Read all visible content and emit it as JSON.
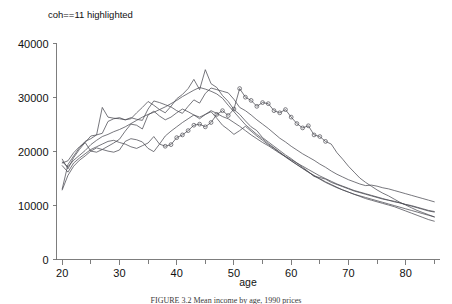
{
  "figure": {
    "caption": "FIGURE 3.2  Mean income by age, 1990 prices"
  },
  "chart_data": {
    "type": "line",
    "title": "coh==11 highlighted",
    "xlabel": "age",
    "ylabel": "",
    "xlim": [
      19,
      86
    ],
    "ylim": [
      0,
      42000
    ],
    "grid": false,
    "legend": "none",
    "xticks": [
      20,
      30,
      40,
      50,
      60,
      70,
      80
    ],
    "xminorticks": [
      25,
      35,
      45,
      55,
      65,
      75,
      85
    ],
    "yticks": [
      0,
      10000,
      20000,
      30000,
      40000
    ],
    "xticklabels": [
      "20",
      "30",
      "40",
      "50",
      "60",
      "70",
      "80"
    ],
    "yticklabels": [
      "0",
      "10000",
      "20000",
      "30000",
      "40000"
    ],
    "highlighted_series": "coh==11",
    "marker": "open-circle",
    "series": [
      {
        "name": "coh==7",
        "highlighted": false,
        "x": [
          20,
          21,
          22,
          23,
          24,
          25,
          26,
          27,
          28,
          29,
          30,
          31,
          32,
          33,
          34,
          35,
          36,
          37,
          38,
          39,
          40,
          41,
          42,
          43,
          44,
          45,
          46,
          47,
          48,
          49,
          50,
          51,
          52,
          53,
          54,
          55,
          56,
          57,
          58,
          59,
          60,
          61,
          62,
          63,
          64,
          65,
          66,
          67,
          68,
          69,
          70,
          71,
          72,
          73,
          74,
          75,
          76,
          77,
          78,
          79,
          80,
          81,
          82,
          83,
          84,
          85
        ],
        "y": [
          18600,
          16800,
          18900,
          20400,
          21700,
          22900,
          23100,
          23400,
          25600,
          26100,
          26300,
          25900,
          26100,
          27200,
          28200,
          29300,
          28600,
          27800,
          27200,
          28400,
          29800,
          30600,
          31700,
          33400,
          31500,
          35200,
          32600,
          31900,
          30400,
          29300,
          27800,
          26900,
          25700,
          24600,
          23900,
          22600,
          21800,
          21000,
          20200,
          19400,
          18700,
          17900,
          17100,
          16300,
          15400,
          15200,
          14900,
          14300,
          13900,
          13500,
          13100,
          12700,
          12400,
          12100,
          11800,
          11500,
          11200,
          11000,
          10700,
          10500,
          10200,
          9900,
          9600,
          9300,
          9000,
          8800
        ]
      },
      {
        "name": "coh==8",
        "highlighted": false,
        "x": [
          20,
          21,
          22,
          23,
          24,
          25,
          26,
          27,
          28,
          29,
          30,
          31,
          32,
          33,
          34,
          35,
          36,
          37,
          38,
          39,
          40,
          41,
          42,
          43,
          44,
          45,
          46,
          47,
          48,
          49,
          50,
          51,
          52,
          53,
          54,
          55,
          56,
          57,
          58,
          59,
          60,
          61,
          62,
          63,
          64,
          65,
          66,
          67,
          68,
          69,
          70,
          71,
          72,
          73,
          74,
          75,
          76,
          77,
          78,
          79,
          80,
          81,
          82,
          83,
          84,
          85
        ],
        "y": [
          13100,
          17600,
          19200,
          20700,
          21900,
          22400,
          23100,
          28200,
          26400,
          26200,
          26100,
          25900,
          26300,
          26000,
          25800,
          27900,
          29400,
          29100,
          28700,
          28300,
          27600,
          27100,
          28400,
          29600,
          29000,
          30800,
          31800,
          31500,
          31200,
          30900,
          29700,
          28200,
          27600,
          26800,
          25900,
          25100,
          24300,
          23400,
          22500,
          21800,
          21000,
          20300,
          19600,
          19000,
          18400,
          17700,
          17100,
          16400,
          15800,
          15300,
          14800,
          14400,
          14000,
          13700,
          13800,
          13600,
          13300,
          13100,
          12800,
          12500,
          12200,
          11900,
          11600,
          11300,
          11000,
          10700
        ]
      },
      {
        "name": "coh==9",
        "highlighted": false,
        "x": [
          20,
          21,
          22,
          23,
          24,
          25,
          26,
          27,
          28,
          29,
          30,
          31,
          32,
          33,
          34,
          35,
          36,
          37,
          38,
          39,
          40,
          41,
          42,
          43,
          44,
          45,
          46,
          47,
          48,
          49,
          50,
          51,
          52,
          53,
          54,
          55,
          56,
          57,
          58,
          59,
          60,
          61,
          62,
          63,
          64,
          65,
          66,
          67,
          68,
          69,
          70,
          71,
          72,
          73,
          74,
          75,
          76,
          77,
          78,
          79,
          80,
          81,
          82,
          83,
          84,
          85
        ],
        "y": [
          17900,
          18300,
          19800,
          20900,
          21700,
          20100,
          19900,
          20400,
          21000,
          21600,
          22300,
          23800,
          25100,
          24900,
          24200,
          26800,
          27500,
          26600,
          25900,
          26400,
          27200,
          27900,
          27400,
          26800,
          26100,
          26900,
          27600,
          27100,
          26500,
          26100,
          25400,
          24700,
          23900,
          23100,
          22400,
          21700,
          21100,
          20400,
          19700,
          19100,
          18500,
          17900,
          17300,
          16700,
          16100,
          15500,
          15000,
          14500,
          14000,
          13600,
          13200,
          12800,
          12500,
          12200,
          11900,
          11600,
          11300,
          11000,
          10800,
          10500,
          10200,
          10000,
          9700,
          9400,
          9100,
          8900
        ]
      },
      {
        "name": "coh==10",
        "highlighted": false,
        "x": [
          20,
          21,
          22,
          23,
          24,
          25,
          26,
          27,
          28,
          29,
          30,
          31,
          32,
          33,
          34,
          35,
          36,
          37,
          38,
          39,
          40,
          41,
          42,
          43,
          44,
          45,
          46,
          47,
          48,
          49,
          50,
          51,
          52,
          53,
          54,
          55,
          56,
          57,
          58,
          59,
          60,
          61,
          62,
          63,
          64,
          65,
          66,
          67,
          68,
          69,
          70,
          71,
          72,
          73,
          74,
          75,
          76,
          77,
          78,
          79,
          80,
          81,
          82,
          83,
          84,
          85
        ],
        "y": [
          18100,
          17200,
          18400,
          19300,
          20200,
          21300,
          22100,
          22800,
          23200,
          23700,
          24100,
          24600,
          25200,
          25800,
          26400,
          26900,
          27300,
          27800,
          28300,
          28900,
          29500,
          30200,
          30800,
          31400,
          31900,
          31600,
          31200,
          30700,
          29900,
          28600,
          27400,
          26200,
          25000,
          24100,
          23200,
          22400,
          21500,
          20700,
          19900,
          19100,
          18300,
          17600,
          16900,
          16200,
          15500,
          14900,
          14300,
          13800,
          13300,
          12900,
          12500,
          12100,
          11800,
          11500,
          11200,
          10900,
          10600,
          10300,
          10000,
          9700,
          9400,
          9100,
          8800,
          8500,
          8200,
          7900
        ]
      },
      {
        "name": "coh==12",
        "highlighted": false,
        "x": [
          20,
          21,
          22,
          23,
          24,
          25,
          26,
          27,
          28,
          29,
          30,
          31,
          32,
          33,
          34,
          35,
          36,
          37,
          38,
          39,
          40,
          41,
          42,
          43,
          44,
          45,
          46,
          47,
          48,
          49,
          50,
          51,
          52,
          53,
          54,
          55,
          56,
          57,
          58,
          59,
          60,
          61,
          62,
          63,
          64,
          65,
          66,
          67,
          68,
          69,
          70,
          71,
          72,
          73,
          74,
          75,
          76,
          77,
          78,
          79,
          80,
          81,
          82,
          83,
          84,
          85
        ],
        "y": [
          12900,
          15600,
          17300,
          18400,
          19200,
          20100,
          20700,
          20400,
          20100,
          19900,
          20300,
          21900,
          22400,
          22200,
          21800,
          20600,
          20000,
          21400,
          22900,
          23800,
          24600,
          25400,
          26100,
          26800,
          26400,
          26900,
          27400,
          26200,
          24900,
          24100,
          23200,
          23900,
          24700,
          23800,
          22900,
          22100,
          21300,
          20600,
          19800,
          19000,
          18300,
          17600,
          16900,
          16200,
          15600,
          15000,
          14400,
          13900,
          13400,
          12900,
          12500,
          12100,
          11700,
          11300,
          11000,
          10700,
          10400,
          10100,
          9800,
          9400,
          9000,
          8600,
          8200,
          7800,
          7400,
          7100
        ]
      },
      {
        "name": "coh==11",
        "highlighted": true,
        "x": [
          20,
          21,
          22,
          23,
          24,
          25,
          26,
          27,
          28,
          29,
          30,
          31,
          32,
          33,
          34,
          35,
          36,
          37,
          38,
          39,
          40,
          41,
          42,
          43,
          44,
          45,
          46,
          47,
          48,
          49,
          50,
          51,
          52,
          53,
          54,
          55,
          56,
          57,
          58,
          59,
          60,
          61,
          62,
          63,
          64,
          65,
          66,
          67,
          68,
          69,
          70,
          71,
          72,
          73,
          74,
          75,
          76,
          77,
          78,
          79,
          80,
          81,
          82,
          83,
          84,
          85
        ],
        "y": [
          17400,
          16200,
          17900,
          18800,
          19600,
          20400,
          20900,
          21400,
          21900,
          22100,
          21700,
          21400,
          20900,
          20600,
          21100,
          21600,
          22800,
          21400,
          21000,
          21300,
          22600,
          23100,
          23900,
          24900,
          25100,
          24600,
          25400,
          26900,
          27600,
          26700,
          27900,
          31700,
          30100,
          29500,
          28400,
          29100,
          28900,
          27600,
          27200,
          27800,
          26400,
          25200,
          24400,
          24800,
          23100,
          22800,
          21900,
          21400,
          19800,
          18600,
          17300,
          16200,
          15100,
          14300,
          13600,
          12900,
          12300,
          11800,
          11200,
          10600,
          10100,
          9600,
          9100,
          8700,
          8300,
          7900
        ]
      }
    ]
  },
  "axes": {
    "x_axis_name": "age-axis",
    "y_axis_name": "income-axis"
  }
}
